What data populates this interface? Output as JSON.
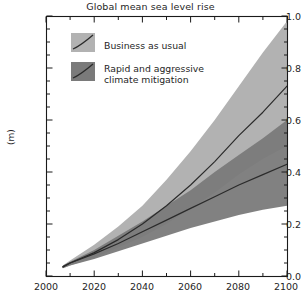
{
  "chart_data": {
    "type": "area",
    "title": "Global mean sea level rise",
    "xlabel": "",
    "ylabel": "(m)",
    "xlim": [
      2000,
      2100
    ],
    "ylim": [
      0.0,
      1.0
    ],
    "grid": false,
    "legend_position": "upper-left-inside",
    "x_ticks": [
      2000,
      2020,
      2040,
      2060,
      2080,
      2100
    ],
    "x_tick_labels": [
      "2000",
      "2020",
      "2040",
      "2060",
      "2080",
      "2100"
    ],
    "x_minor_tick_step": 10,
    "y_ticks": [
      0.0,
      0.2,
      0.4,
      0.6,
      0.8,
      1.0
    ],
    "y_tick_labels": [
      "0.0",
      "0.2",
      "0.4",
      "0.6",
      "0.8",
      "1.0"
    ],
    "y_minor_tick_step": 0.05,
    "x": [
      2007,
      2010,
      2020,
      2030,
      2040,
      2050,
      2060,
      2070,
      2080,
      2090,
      2100
    ],
    "series": [
      {
        "name": "Business as usual",
        "color": "#b2b2b2",
        "line_color": "#2b2b2b",
        "median": [
          0.035,
          0.05,
          0.09,
          0.14,
          0.2,
          0.27,
          0.35,
          0.44,
          0.54,
          0.63,
          0.73
        ],
        "lower": [
          0.03,
          0.04,
          0.07,
          0.11,
          0.15,
          0.2,
          0.26,
          0.32,
          0.39,
          0.45,
          0.5
        ],
        "upper": [
          0.04,
          0.06,
          0.12,
          0.19,
          0.27,
          0.37,
          0.48,
          0.6,
          0.73,
          0.86,
          0.98
        ]
      },
      {
        "name": "Rapid and aggressive climate mitigation",
        "color": "#7a7a7a",
        "line_color": "#2b2b2b",
        "median": [
          0.035,
          0.05,
          0.085,
          0.125,
          0.17,
          0.215,
          0.26,
          0.305,
          0.35,
          0.39,
          0.43
        ],
        "lower": [
          0.03,
          0.04,
          0.065,
          0.095,
          0.125,
          0.155,
          0.185,
          0.21,
          0.235,
          0.255,
          0.27
        ],
        "upper": [
          0.04,
          0.055,
          0.1,
          0.155,
          0.21,
          0.27,
          0.33,
          0.4,
          0.465,
          0.53,
          0.6
        ]
      }
    ]
  },
  "legend": {
    "items": [
      {
        "label": "Business as usual",
        "label_line2": "",
        "swatch": "#b2b2b2"
      },
      {
        "label": "Rapid and aggressive",
        "label_line2": "climate mitigation",
        "swatch": "#7a7a7a"
      }
    ]
  },
  "colors": {
    "band_light": "#b2b2b2",
    "band_dark": "#7a7a7a",
    "line": "#2b2b2b",
    "axis": "#1a1a1a",
    "background": "#ffffff"
  }
}
